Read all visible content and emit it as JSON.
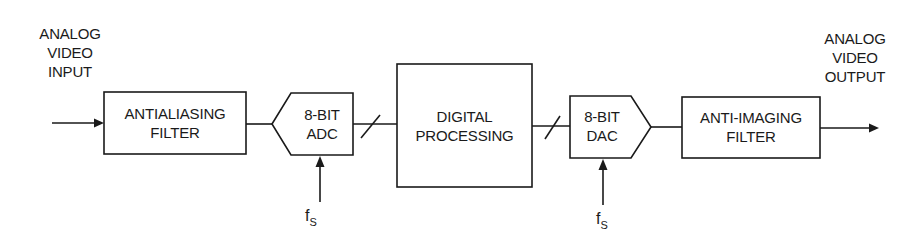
{
  "diagram": {
    "type": "signal-chain block diagram",
    "input_label": [
      "ANALOG",
      "VIDEO",
      "INPUT"
    ],
    "output_label": [
      "ANALOG",
      "VIDEO",
      "OUTPUT"
    ],
    "blocks": [
      {
        "id": "antialiasing-filter",
        "lines": [
          "ANTIALIASING",
          "FILTER"
        ],
        "shape": "rectangle"
      },
      {
        "id": "adc",
        "lines": [
          "8-BIT",
          "ADC"
        ],
        "shape": "pentagon-left"
      },
      {
        "id": "digital-processing",
        "lines": [
          "DIGITAL",
          "PROCESSING"
        ],
        "shape": "rectangle"
      },
      {
        "id": "dac",
        "lines": [
          "8-BIT",
          "DAC"
        ],
        "shape": "pentagon-right"
      },
      {
        "id": "anti-imaging-filter",
        "lines": [
          "ANTI-IMAGING",
          "FILTER"
        ],
        "shape": "rectangle"
      }
    ],
    "clock": {
      "symbol": "f",
      "subscript": "S"
    },
    "connections": [
      {
        "from": "input",
        "to": "antialiasing-filter",
        "arrow": true
      },
      {
        "from": "antialiasing-filter",
        "to": "adc",
        "arrow": false
      },
      {
        "from": "adc",
        "to": "digital-processing",
        "bus": true
      },
      {
        "from": "digital-processing",
        "to": "dac",
        "bus": true
      },
      {
        "from": "dac",
        "to": "anti-imaging-filter",
        "arrow": false
      },
      {
        "from": "anti-imaging-filter",
        "to": "output",
        "arrow": true
      },
      {
        "from": "fs",
        "to": "adc",
        "arrow": true
      },
      {
        "from": "fs",
        "to": "dac",
        "arrow": true
      }
    ]
  }
}
